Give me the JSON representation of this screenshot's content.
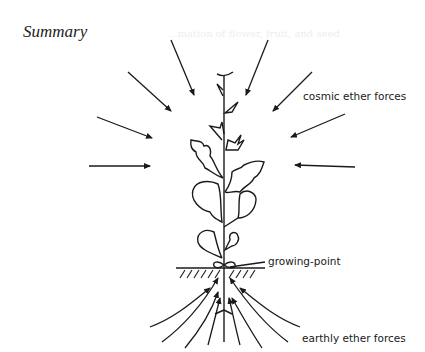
{
  "title": "Summary",
  "labels": {
    "cosmic": "cosmic ether forces",
    "growing_point": "growing-point",
    "earthly": "earthly ether forces"
  },
  "bleed_through": {
    "heading": "...mation of flower, fruit, and seed"
  },
  "diagram": {
    "cosmic_arrows": 8,
    "earthly_arrows": 8,
    "colors": {
      "line": "#1a1a1a",
      "background": "#ffffff"
    }
  }
}
